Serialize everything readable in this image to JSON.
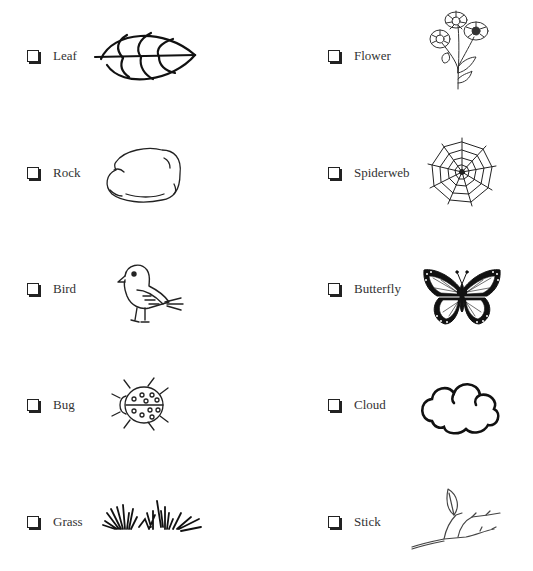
{
  "worksheet": {
    "items": [
      {
        "id": "leaf",
        "label": "Leaf",
        "icon": "leaf-icon",
        "checked": false,
        "column": "left"
      },
      {
        "id": "rock",
        "label": "Rock",
        "icon": "rock-icon",
        "checked": false,
        "column": "left"
      },
      {
        "id": "bird",
        "label": "Bird",
        "icon": "bird-icon",
        "checked": false,
        "column": "left"
      },
      {
        "id": "bug",
        "label": "Bug",
        "icon": "ladybug-icon",
        "checked": false,
        "column": "left"
      },
      {
        "id": "grass",
        "label": "Grass",
        "icon": "grass-icon",
        "checked": false,
        "column": "left"
      },
      {
        "id": "flower",
        "label": "Flower",
        "icon": "flower-icon",
        "checked": false,
        "column": "right"
      },
      {
        "id": "spiderweb",
        "label": "Spiderweb",
        "icon": "spiderweb-icon",
        "checked": false,
        "column": "right"
      },
      {
        "id": "butterfly",
        "label": "Butterfly",
        "icon": "butterfly-icon",
        "checked": false,
        "column": "right"
      },
      {
        "id": "cloud",
        "label": "Cloud",
        "icon": "cloud-icon",
        "checked": false,
        "column": "right"
      },
      {
        "id": "stick",
        "label": "Stick",
        "icon": "stick-icon",
        "checked": false,
        "column": "right"
      }
    ]
  }
}
